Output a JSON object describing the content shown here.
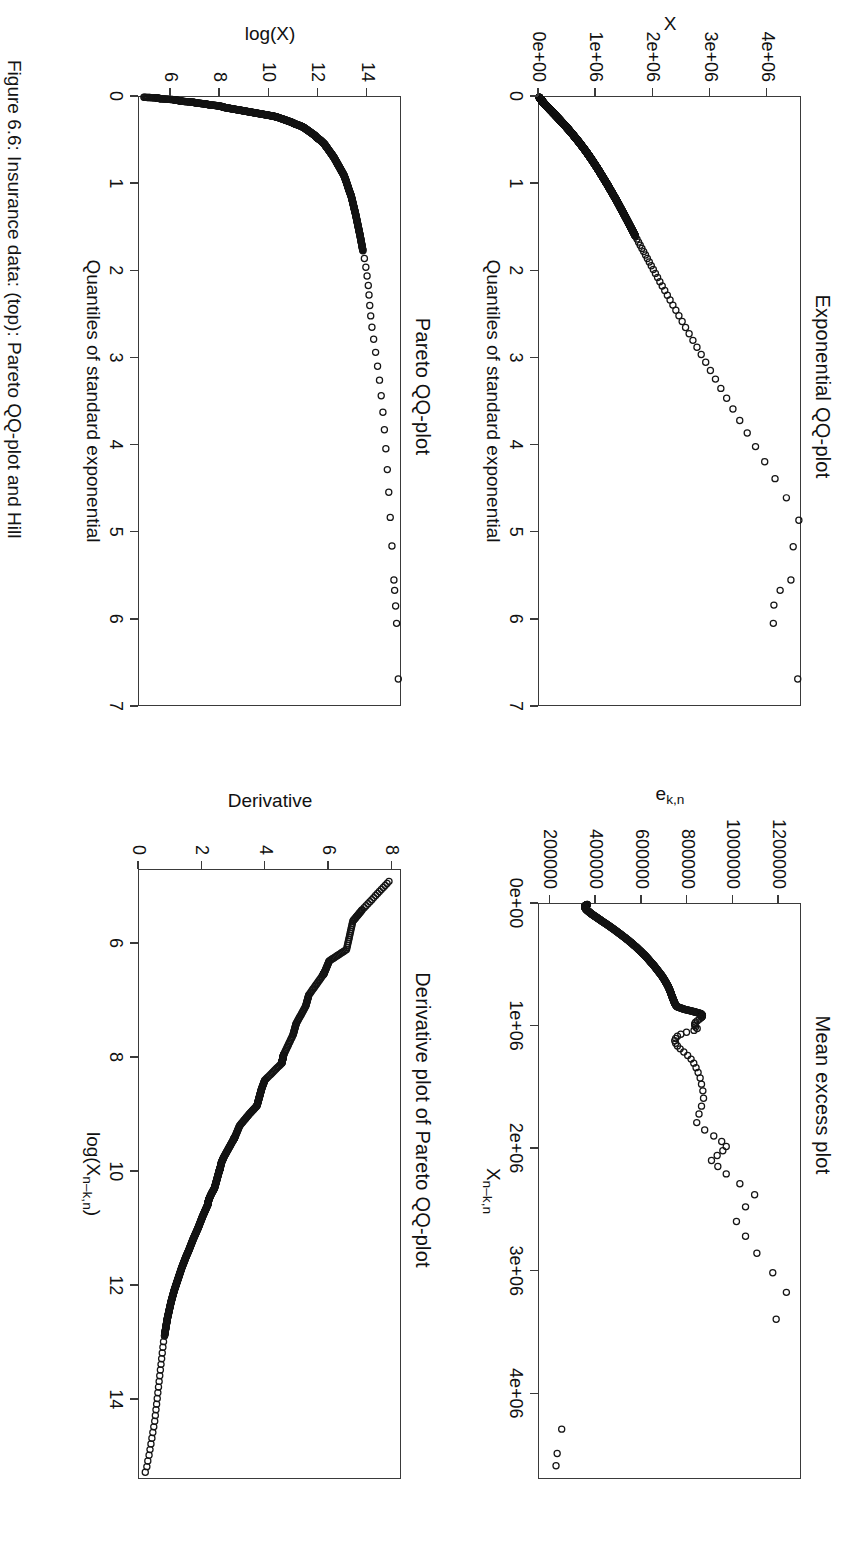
{
  "figure": {
    "orientation_degrees": 90,
    "background": "#ffffff",
    "ink": "#111111",
    "caption": "Figure 6.6: Insurance data: (top): Pareto QQ-plot and Hill"
  },
  "chart_data": [
    {
      "id": "exponential-qq",
      "type": "scatter",
      "title": "Exponential QQ-plot",
      "xlabel": "Quantiles of standard exponential",
      "ylabel": "X",
      "xlim": [
        0,
        7
      ],
      "ylim": [
        0,
        4600000
      ],
      "xticks": [
        0,
        1,
        2,
        3,
        4,
        5,
        6,
        7
      ],
      "xticklabels": [
        "0",
        "1",
        "2",
        "3",
        "4",
        "5",
        "6",
        "7"
      ],
      "yticks": [
        0,
        1000000,
        2000000,
        3000000,
        4000000
      ],
      "yticklabels": [
        "0e+00",
        "1e+06",
        "2e+06",
        "3e+06",
        "4e+06"
      ],
      "grid": false,
      "legend": "none",
      "marker": "open-circle",
      "x": [
        0.003,
        0.008,
        0.013,
        0.018,
        0.023,
        0.028,
        0.034,
        0.039,
        0.045,
        0.05,
        0.056,
        0.062,
        0.068,
        0.074,
        0.08,
        0.086,
        0.092,
        0.098,
        0.105,
        0.111,
        0.118,
        0.124,
        0.131,
        0.138,
        0.145,
        0.152,
        0.159,
        0.166,
        0.173,
        0.181,
        0.188,
        0.196,
        0.203,
        0.211,
        0.219,
        0.227,
        0.235,
        0.243,
        0.251,
        0.26,
        0.268,
        0.277,
        0.286,
        0.294,
        0.303,
        0.312,
        0.322,
        0.331,
        0.34,
        0.35,
        0.36,
        0.369,
        0.379,
        0.389,
        0.4,
        0.41,
        0.42,
        0.431,
        0.442,
        0.453,
        0.464,
        0.475,
        0.486,
        0.498,
        0.51,
        0.521,
        0.533,
        0.546,
        0.558,
        0.571,
        0.583,
        0.596,
        0.609,
        0.623,
        0.636,
        0.65,
        0.664,
        0.678,
        0.692,
        0.707,
        0.721,
        0.736,
        0.752,
        0.767,
        0.783,
        0.799,
        0.815,
        0.832,
        0.848,
        0.866,
        0.883,
        0.901,
        0.919,
        0.937,
        0.956,
        0.975,
        0.994,
        1.014,
        1.034,
        1.055,
        1.076,
        1.097,
        1.119,
        1.141,
        1.163,
        1.186,
        1.21,
        1.234,
        1.259,
        1.284,
        1.309,
        1.336,
        1.363,
        1.39,
        1.418,
        1.447,
        1.477,
        1.507,
        1.538,
        1.57,
        1.603,
        1.636,
        1.671,
        1.706,
        1.743,
        1.78,
        1.819,
        1.859,
        1.9,
        1.942,
        1.986,
        2.031,
        2.078,
        2.126,
        2.176,
        2.228,
        2.282,
        2.338,
        2.396,
        2.456,
        2.519,
        2.585,
        2.654,
        2.726,
        2.802,
        2.881,
        2.965,
        3.054,
        3.148,
        3.248,
        3.355,
        3.469,
        3.592,
        3.724,
        3.868,
        4.025,
        4.199,
        4.394,
        4.615,
        4.872,
        5.178,
        5.561,
        5.68,
        5.85,
        6.06,
        6.7
      ],
      "y": [
        4000,
        9000,
        15000,
        21000,
        27000,
        33000,
        39000,
        46000,
        53000,
        60000,
        67000,
        75000,
        83000,
        91000,
        99000,
        107000,
        116000,
        125000,
        134000,
        143000,
        153000,
        162000,
        172000,
        182000,
        192000,
        203000,
        213000,
        224000,
        234000,
        245000,
        256000,
        268000,
        279000,
        290000,
        302000,
        313000,
        325000,
        337000,
        349000,
        361000,
        373000,
        386000,
        398000,
        410000,
        423000,
        436000,
        448000,
        461000,
        474000,
        487000,
        500000,
        514000,
        527000,
        540000,
        554000,
        567000,
        581000,
        595000,
        608000,
        622000,
        636000,
        650000,
        664000,
        678000,
        693000,
        707000,
        721000,
        736000,
        750000,
        765000,
        779000,
        794000,
        809000,
        824000,
        839000,
        854000,
        869000,
        884000,
        899000,
        914000,
        929000,
        945000,
        960000,
        976000,
        992000,
        1008000,
        1024000,
        1040000,
        1056000,
        1072000,
        1088000,
        1105000,
        1122000,
        1139000,
        1156000,
        1174000,
        1192000,
        1210000,
        1228000,
        1246000,
        1265000,
        1284000,
        1303000,
        1322000,
        1342000,
        1362000,
        1382000,
        1402000,
        1422000,
        1443000,
        1464000,
        1486000,
        1508000,
        1530000,
        1553000,
        1576000,
        1600000,
        1624000,
        1649000,
        1674000,
        1700000,
        1727000,
        1755000,
        1784000,
        1814000,
        1845000,
        1877000,
        1910000,
        1944000,
        1979000,
        2015000,
        2052000,
        2090000,
        2130000,
        2172000,
        2216000,
        2262000,
        2310000,
        2360000,
        2412000,
        2466000,
        2523000,
        2583000,
        2646000,
        2713000,
        2784000,
        2859000,
        2938000,
        3021000,
        3110000,
        3205000,
        3307000,
        3418000,
        3538000,
        3670000,
        3816000,
        3978000,
        4160000,
        4360000,
        4580000,
        4480000,
        4440000,
        4250000,
        4140000,
        4130000,
        4560000
      ]
    },
    {
      "id": "mean-excess",
      "type": "scatter",
      "title": "Mean excess plot",
      "xlabel": "X_{n-k,n}",
      "ylabel": "e_{k,n}",
      "xlim": [
        0,
        4700000
      ],
      "ylim": [
        150000,
        1300000
      ],
      "xticks": [
        0,
        1000000,
        2000000,
        3000000,
        4000000
      ],
      "xticklabels": [
        "0e+00",
        "1e+06",
        "2e+06",
        "3e+06",
        "4e+06"
      ],
      "yticks": [
        200000,
        400000,
        600000,
        800000,
        1000000,
        1200000
      ],
      "yticklabels": [
        "200000",
        "400000",
        "600000",
        "800000",
        "1000000",
        "1200000"
      ],
      "grid": false,
      "legend": "none",
      "marker": "open-circle",
      "x": [
        4000,
        12000,
        22000,
        34000,
        48000,
        64000,
        82000,
        100000,
        120000,
        141000,
        163000,
        186000,
        210000,
        235000,
        260000,
        286000,
        312000,
        339000,
        366000,
        393000,
        420000,
        448000,
        476000,
        504000,
        532000,
        560000,
        588000,
        616000,
        644000,
        672000,
        700000,
        728000,
        756000,
        784000,
        812000,
        840000,
        862000,
        880000,
        897000,
        912000,
        927000,
        941000,
        955000,
        968000,
        981000,
        994000,
        1007000,
        1020000,
        1035000,
        1050000,
        1066000,
        1083000,
        1101000,
        1120000,
        1140000,
        1162000,
        1186000,
        1212000,
        1240000,
        1270000,
        1303000,
        1340000,
        1380000,
        1425000,
        1475000,
        1530000,
        1590000,
        1655000,
        1720000,
        1790000,
        1850000,
        1900000,
        1945000,
        1985000,
        2020000,
        2060000,
        2100000,
        2150000,
        2210000,
        2290000,
        2380000,
        2480000,
        2600000,
        2720000,
        2860000,
        3020000,
        3180000,
        3400000,
        4300000,
        4500000,
        4600000
      ],
      "y": [
        363000,
        355000,
        352000,
        354000,
        360000,
        370000,
        382000,
        396000,
        412000,
        428000,
        446000,
        464000,
        482000,
        500000,
        518000,
        536000,
        553000,
        570000,
        586000,
        601000,
        616000,
        630000,
        643000,
        656000,
        668000,
        680000,
        691000,
        701000,
        710000,
        718000,
        725000,
        731000,
        736000,
        742000,
        748000,
        757000,
        790000,
        830000,
        862000,
        870000,
        866000,
        858000,
        848000,
        840000,
        836000,
        836000,
        840000,
        847000,
        833000,
        800000,
        775000,
        760000,
        752000,
        748000,
        752000,
        760000,
        772000,
        788000,
        805000,
        820000,
        832000,
        842000,
        851000,
        860000,
        866000,
        872000,
        875000,
        866000,
        855000,
        845000,
        880000,
        920000,
        955000,
        975000,
        960000,
        935000,
        910000,
        938000,
        975000,
        1035000,
        1100000,
        1060000,
        1020000,
        1060000,
        1110000,
        1180000,
        1240000,
        1195000,
        250000,
        230000,
        225000
      ]
    },
    {
      "id": "pareto-qq",
      "type": "scatter",
      "title": "Pareto QQ-plot",
      "xlabel": "Quantiles of standard exponential",
      "ylabel": "log(X)",
      "xlim": [
        0,
        7
      ],
      "ylim": [
        4.7,
        15.4
      ],
      "xticks": [
        0,
        1,
        2,
        3,
        4,
        5,
        6,
        7
      ],
      "xticklabels": [
        "0",
        "1",
        "2",
        "3",
        "4",
        "5",
        "6",
        "7"
      ],
      "yticks": [
        6,
        8,
        10,
        12,
        14
      ],
      "yticklabels": [
        "6",
        "8",
        "10",
        "12",
        "14"
      ],
      "grid": false,
      "legend": "none",
      "marker": "open-circle",
      "x": [
        0.003,
        0.01,
        0.02,
        0.03,
        0.04,
        0.05,
        0.06,
        0.07,
        0.08,
        0.09,
        0.1,
        0.11,
        0.12,
        0.13,
        0.14,
        0.15,
        0.16,
        0.17,
        0.18,
        0.19,
        0.2,
        0.21,
        0.22,
        0.23,
        0.25,
        0.27,
        0.29,
        0.31,
        0.33,
        0.35,
        0.38,
        0.41,
        0.44,
        0.47,
        0.5,
        0.54,
        0.58,
        0.62,
        0.66,
        0.7,
        0.75,
        0.8,
        0.85,
        0.9,
        0.96,
        1.02,
        1.08,
        1.14,
        1.21,
        1.28,
        1.35,
        1.43,
        1.51,
        1.59,
        1.68,
        1.77,
        1.86,
        1.96,
        2.06,
        2.17,
        2.28,
        2.4,
        2.52,
        2.65,
        2.79,
        2.94,
        3.1,
        3.26,
        3.44,
        3.63,
        3.83,
        4.05,
        4.29,
        4.55,
        4.84,
        5.17,
        5.56,
        5.68,
        5.86,
        6.06,
        6.7
      ],
      "y": [
        4.9,
        5.4,
        5.6,
        6.1,
        6.3,
        6.5,
        6.9,
        7.1,
        7.4,
        7.6,
        7.9,
        8.1,
        8.2,
        8.4,
        8.6,
        8.8,
        9.0,
        9.2,
        9.4,
        9.6,
        9.8,
        10.0,
        10.2,
        10.35,
        10.55,
        10.75,
        10.95,
        11.1,
        11.3,
        11.45,
        11.6,
        11.75,
        11.9,
        12.0,
        12.15,
        12.3,
        12.4,
        12.5,
        12.6,
        12.7,
        12.8,
        12.9,
        13.0,
        13.1,
        13.18,
        13.25,
        13.32,
        13.4,
        13.46,
        13.52,
        13.58,
        13.64,
        13.7,
        13.76,
        13.82,
        13.88,
        13.94,
        14.0,
        14.05,
        14.1,
        14.13,
        14.16,
        14.2,
        14.25,
        14.32,
        14.4,
        14.48,
        14.56,
        14.63,
        14.7,
        14.76,
        14.82,
        14.88,
        14.94,
        15.0,
        15.07,
        15.15,
        15.18,
        15.22,
        15.26,
        15.33
      ]
    },
    {
      "id": "derivative-pareto-qq",
      "type": "scatter",
      "title": "Derivative plot of Pareto QQ-plot",
      "xlabel": "log(X_{n-k,n})",
      "ylabel": "Derivative",
      "xlim": [
        4.7,
        15.4
      ],
      "ylim": [
        0,
        8.3
      ],
      "xticks": [
        6,
        8,
        10,
        12,
        14
      ],
      "xticklabels": [
        "6",
        "8",
        "10",
        "12",
        "14"
      ],
      "yticks": [
        0,
        2,
        4,
        6,
        8
      ],
      "yticklabels": [
        "0",
        "2",
        "4",
        "6",
        "8"
      ],
      "grid": false,
      "legend": "none",
      "marker": "open-circle",
      "x": [
        4.9,
        5.4,
        5.6,
        6.1,
        6.3,
        6.5,
        6.55,
        6.9,
        7.1,
        7.4,
        7.6,
        7.95,
        8.0,
        8.05,
        8.1,
        8.4,
        8.55,
        8.65,
        8.75,
        8.85,
        9.0,
        9.2,
        9.4,
        9.45,
        9.6,
        9.75,
        9.85,
        9.95,
        10.0,
        10.1,
        10.2,
        10.3,
        10.4,
        10.5,
        10.55,
        10.6,
        10.7,
        10.8,
        10.9,
        11.0,
        11.1,
        11.2,
        11.3,
        11.4,
        11.5,
        11.6,
        11.7,
        11.8,
        11.9,
        12.0,
        12.1,
        12.2,
        12.3,
        12.4,
        12.5,
        12.6,
        12.7,
        12.8,
        12.9,
        13.0,
        13.1,
        13.2,
        13.3,
        13.4,
        13.5,
        13.6,
        13.7,
        13.8,
        13.9,
        14.0,
        14.1,
        14.2,
        14.3,
        14.4,
        14.5,
        14.6,
        14.7,
        14.8,
        14.9,
        15.0,
        15.1,
        15.2,
        15.3
      ],
      "y": [
        7.95,
        7.1,
        6.8,
        6.6,
        6.05,
        5.9,
        5.85,
        5.4,
        5.3,
        5.0,
        4.9,
        4.6,
        4.58,
        4.56,
        4.54,
        4.0,
        3.9,
        3.85,
        3.8,
        3.75,
        3.5,
        3.2,
        3.05,
        3.0,
        2.85,
        2.7,
        2.62,
        2.58,
        2.55,
        2.5,
        2.45,
        2.4,
        2.3,
        2.22,
        2.2,
        2.18,
        2.1,
        2.02,
        1.95,
        1.88,
        1.8,
        1.72,
        1.65,
        1.58,
        1.5,
        1.43,
        1.36,
        1.3,
        1.24,
        1.18,
        1.12,
        1.07,
        1.02,
        0.98,
        0.94,
        0.9,
        0.87,
        0.84,
        0.81,
        0.78,
        0.76,
        0.74,
        0.72,
        0.7,
        0.68,
        0.66,
        0.64,
        0.62,
        0.6,
        0.58,
        0.56,
        0.54,
        0.52,
        0.5,
        0.47,
        0.44,
        0.41,
        0.38,
        0.35,
        0.32,
        0.28,
        0.25,
        0.2
      ]
    }
  ]
}
